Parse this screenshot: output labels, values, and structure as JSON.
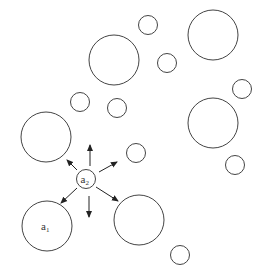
{
  "diagram": {
    "stroke_color": "#444444",
    "background": "#ffffff",
    "circles": [
      {
        "id": "c1",
        "cx": 114,
        "cy": 60,
        "r": 25
      },
      {
        "id": "c2",
        "cx": 148,
        "cy": 25,
        "r": 9.5
      },
      {
        "id": "c3",
        "cx": 213,
        "cy": 35,
        "r": 25
      },
      {
        "id": "c4",
        "cx": 167,
        "cy": 63,
        "r": 9.5
      },
      {
        "id": "c5",
        "cx": 80,
        "cy": 102,
        "r": 9.5
      },
      {
        "id": "c6",
        "cx": 117,
        "cy": 108,
        "r": 9.5
      },
      {
        "id": "c7",
        "cx": 242,
        "cy": 89,
        "r": 9.5
      },
      {
        "id": "c8",
        "cx": 213,
        "cy": 123,
        "r": 25
      },
      {
        "id": "c9",
        "cx": 46,
        "cy": 137,
        "r": 25
      },
      {
        "id": "c10",
        "cx": 136,
        "cy": 153,
        "r": 9.5
      },
      {
        "id": "c11",
        "cx": 235,
        "cy": 165,
        "r": 9.5
      },
      {
        "id": "a2",
        "cx": 86,
        "cy": 179,
        "r": 9.5,
        "label": "a",
        "subscript": "2"
      },
      {
        "id": "a1",
        "cx": 47,
        "cy": 226,
        "r": 25,
        "label": "a",
        "subscript": "1"
      },
      {
        "id": "c12",
        "cx": 139,
        "cy": 220,
        "r": 25
      },
      {
        "id": "c13",
        "cx": 180,
        "cy": 255,
        "r": 9.5
      }
    ],
    "arrows": [
      {
        "x1": 90,
        "y1": 166,
        "x2": 90,
        "y2": 145
      },
      {
        "x1": 77,
        "y1": 170,
        "x2": 67,
        "y2": 160
      },
      {
        "x1": 99,
        "y1": 172,
        "x2": 117,
        "y2": 162
      },
      {
        "x1": 77,
        "y1": 188,
        "x2": 61,
        "y2": 203
      },
      {
        "x1": 89,
        "y1": 196,
        "x2": 89,
        "y2": 217
      },
      {
        "x1": 96,
        "y1": 187,
        "x2": 118,
        "y2": 201
      }
    ]
  }
}
